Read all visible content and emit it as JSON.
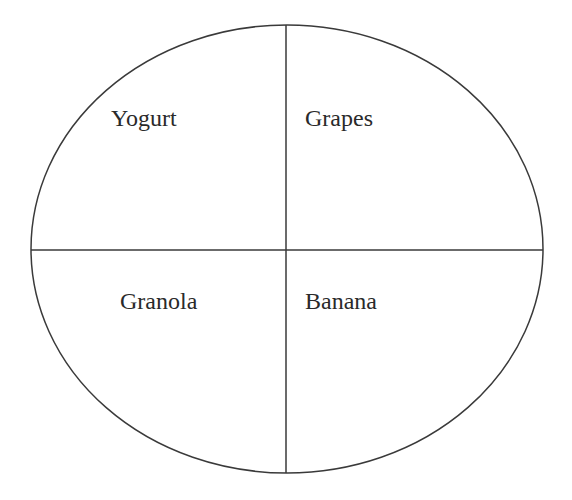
{
  "diagram": {
    "type": "plate-quadrants",
    "stroke_color": "#3a3a3a",
    "background": "#ffffff",
    "quadrants": [
      {
        "position": "top-left",
        "label": "Yogurt"
      },
      {
        "position": "top-right",
        "label": "Grapes"
      },
      {
        "position": "bottom-left",
        "label": "Granola"
      },
      {
        "position": "bottom-right",
        "label": "Banana"
      }
    ]
  }
}
